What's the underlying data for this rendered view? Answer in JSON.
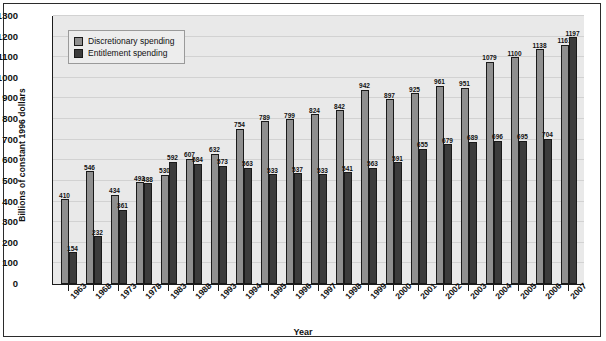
{
  "chart_data": {
    "type": "bar",
    "title": "",
    "xlabel": "Year",
    "ylabel": "Billions of constant 1996 dollars",
    "ylim": [
      0,
      1300
    ],
    "ytick_step": 100,
    "yticks": [
      0,
      100,
      200,
      300,
      400,
      500,
      600,
      700,
      800,
      900,
      1000,
      1100,
      1200,
      1300
    ],
    "grid": true,
    "legend_position": "top-left",
    "categories": [
      "1963",
      "1968",
      "1973",
      "1978",
      "1983",
      "1988",
      "1993",
      "1994",
      "1995",
      "1996",
      "1997",
      "1998",
      "1999",
      "2000",
      "2001",
      "2002",
      "2003",
      "2004",
      "2005",
      "2006",
      "2007"
    ],
    "series": [
      {
        "name": "Discretionary spending",
        "color": "#8f8f8f",
        "values": [
          410,
          546,
          434,
          493,
          530,
          607,
          632,
          754,
          789,
          799,
          824,
          842,
          942,
          897,
          925,
          961,
          951,
          1079,
          1100,
          1138,
          1161
        ]
      },
      {
        "name": "Entitlement spending",
        "color": "#3c3c3c",
        "values": [
          154,
          232,
          361,
          488,
          592,
          584,
          573,
          563,
          533,
          537,
          533,
          541,
          563,
          591,
          655,
          679,
          689,
          696,
          695,
          704,
          1197
        ]
      }
    ]
  },
  "legend": {
    "items": [
      {
        "label": "Discretionary spending",
        "swatch": "legend-swatch-discretionary"
      },
      {
        "label": "Entitlement spending",
        "swatch": "legend-swatch-entitlement"
      }
    ]
  },
  "axes": {
    "y_title": "Billions of constant 1996 dollars",
    "x_title": "Year"
  },
  "colors": {
    "discretionary": "#8f8f8f",
    "entitlement": "#3c3c3c",
    "plot_background": "#e9e9e9",
    "axis": "#1c1c1c"
  }
}
